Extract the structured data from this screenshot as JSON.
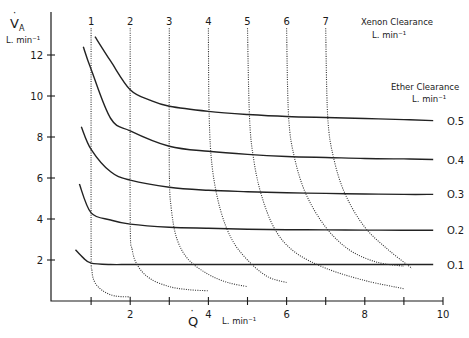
{
  "chart_data": {
    "type": "line",
    "title": "",
    "xlabel": "Q̇",
    "xlabel_units": "L. min⁻¹",
    "ylabel": "V̇A",
    "ylabel_units": "L. min⁻¹",
    "xlim": [
      0,
      10
    ],
    "ylim": [
      0,
      13
    ],
    "x_ticks": [
      1,
      2,
      3,
      4,
      5,
      6,
      7,
      8,
      9,
      10
    ],
    "x_tick_labels": [
      "2",
      "4",
      "6",
      "8",
      "10"
    ],
    "y_ticks": [
      2,
      4,
      6,
      8,
      10,
      12
    ],
    "y_tick_labels": [
      "2",
      "4",
      "6",
      "8",
      "10",
      "12"
    ],
    "grid": false,
    "legend": {
      "xenon_title": "Xenon Clearance",
      "xenon_units": "L. min⁻¹",
      "ether_title": "Ether Clearance",
      "ether_units": "L. min⁻¹"
    },
    "series": [
      {
        "name": "Ether Clearance 0.5",
        "label": "0.5",
        "style": "solid",
        "x": [
          1.1,
          1.5,
          2,
          2.5,
          3,
          4,
          5,
          6,
          7,
          8,
          9,
          10
        ],
        "y": [
          12.9,
          11.7,
          10.3,
          9.8,
          9.5,
          9.25,
          9.1,
          9.0,
          8.95,
          8.9,
          8.85,
          8.8
        ]
      },
      {
        "name": "Ether Clearance 0.4",
        "label": "0.4",
        "style": "solid",
        "x": [
          0.8,
          1,
          1.5,
          2,
          3,
          4,
          5,
          6,
          7,
          8,
          9,
          10
        ],
        "y": [
          12.4,
          11.3,
          8.9,
          8.3,
          7.55,
          7.3,
          7.15,
          7.05,
          7.0,
          6.95,
          6.93,
          6.9
        ]
      },
      {
        "name": "Ether Clearance 0.3",
        "label": "0.3",
        "style": "solid",
        "x": [
          0.75,
          1,
          1.5,
          2,
          3,
          4,
          5,
          6,
          7,
          8,
          9,
          10
        ],
        "y": [
          8.5,
          7.4,
          6.3,
          5.9,
          5.55,
          5.4,
          5.33,
          5.28,
          5.25,
          5.22,
          5.2,
          5.2
        ]
      },
      {
        "name": "Ether Clearance 0.2",
        "label": "0.2",
        "style": "solid",
        "x": [
          0.7,
          1,
          1.5,
          2,
          3,
          4,
          5,
          6,
          7,
          8,
          9,
          10
        ],
        "y": [
          5.7,
          4.3,
          3.95,
          3.75,
          3.6,
          3.55,
          3.5,
          3.48,
          3.47,
          3.46,
          3.45,
          3.45
        ]
      },
      {
        "name": "Ether Clearance 0.1",
        "label": "0.1",
        "style": "solid",
        "x": [
          0.6,
          0.8,
          1,
          1.5,
          2,
          3,
          4,
          5,
          6,
          7,
          8,
          9,
          10
        ],
        "y": [
          2.5,
          2.1,
          1.85,
          1.78,
          1.78,
          1.78,
          1.78,
          1.78,
          1.78,
          1.78,
          1.78,
          1.78,
          1.78
        ]
      },
      {
        "name": "Xenon Clearance 1",
        "label": "1",
        "style": "dotted",
        "x": [
          1.0,
          1.0,
          1.02,
          1.1,
          1.3,
          1.6,
          2.0
        ],
        "y": [
          13.3,
          3.0,
          1.5,
          0.9,
          0.5,
          0.25,
          0.2
        ]
      },
      {
        "name": "Xenon Clearance 2",
        "label": "2",
        "style": "dotted",
        "x": [
          2.0,
          2.0,
          2.05,
          2.2,
          2.5,
          3.0,
          3.5,
          4.0
        ],
        "y": [
          13.3,
          4.0,
          2.5,
          1.7,
          1.1,
          0.7,
          0.55,
          0.5
        ]
      },
      {
        "name": "Xenon Clearance 3",
        "label": "3",
        "style": "dotted",
        "x": [
          3.0,
          3.0,
          3.05,
          3.2,
          3.5,
          4.0,
          4.5,
          5.0
        ],
        "y": [
          13.3,
          6.5,
          4.5,
          3.0,
          2.0,
          1.3,
          0.9,
          0.7
        ]
      },
      {
        "name": "Xenon Clearance 4",
        "label": "4",
        "style": "dotted",
        "x": [
          4.0,
          4.02,
          4.1,
          4.3,
          4.6,
          5.0,
          5.5,
          6.0
        ],
        "y": [
          13.3,
          9.0,
          6.5,
          4.5,
          3.0,
          2.0,
          1.2,
          0.9
        ]
      },
      {
        "name": "Xenon Clearance 5",
        "label": "5",
        "style": "dotted",
        "x": [
          5.0,
          5.05,
          5.15,
          5.35,
          5.7,
          6.2,
          7.0,
          8.0,
          9.0
        ],
        "y": [
          13.3,
          9.0,
          7.0,
          5.2,
          3.5,
          2.4,
          1.6,
          1.0,
          0.6
        ]
      },
      {
        "name": "Xenon Clearance 6",
        "label": "6",
        "style": "dotted",
        "x": [
          6.0,
          6.05,
          6.2,
          6.5,
          7.0,
          7.6,
          8.3,
          9.0
        ],
        "y": [
          13.3,
          9.0,
          7.0,
          5.2,
          3.6,
          2.5,
          1.9,
          1.7
        ]
      },
      {
        "name": "Xenon Clearance 7",
        "label": "7",
        "style": "dotted",
        "x": [
          7.0,
          7.05,
          7.2,
          7.5,
          8.0,
          8.6,
          9.2
        ],
        "y": [
          13.3,
          9.0,
          7.0,
          5.2,
          3.6,
          2.5,
          1.6
        ]
      }
    ]
  }
}
